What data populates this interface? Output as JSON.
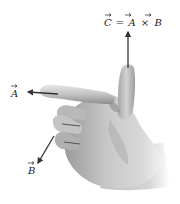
{
  "diagram": {
    "labels": {
      "c_equation": "C = A × B",
      "c_parts": [
        "C",
        "=",
        "A",
        "×",
        "B"
      ],
      "a": "A",
      "b": "B"
    },
    "vectors": [
      {
        "name": "A",
        "direction": "left",
        "along": "index finger"
      },
      {
        "name": "B",
        "direction": "down-left",
        "along": "curled fingers"
      },
      {
        "name": "C",
        "direction": "up",
        "along": "thumb"
      }
    ],
    "colors": {
      "background": "#ffffff",
      "skin_light": "#d9d9d9",
      "skin_mid": "#b5b5b5",
      "skin_dark": "#8a8a8a",
      "arrow": "#333333",
      "text": "#222222"
    }
  }
}
